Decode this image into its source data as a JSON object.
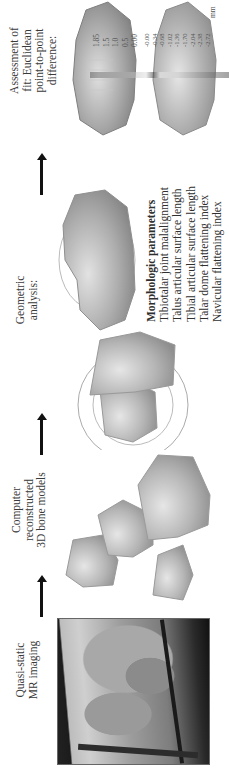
{
  "figure": {
    "steps": [
      {
        "id": "mr",
        "label_lines": [
          "Quasi-static",
          "MR imaging"
        ]
      },
      {
        "id": "models",
        "label_lines": [
          "Computer",
          "reconstructed",
          "3D bone models"
        ]
      },
      {
        "id": "geometric",
        "label_lines": [
          "Geometric",
          "analysis:"
        ]
      },
      {
        "id": "fit",
        "label_lines": [
          "Assessment of",
          "fit: Euclidean",
          "point-to-point",
          "difference:"
        ]
      }
    ],
    "morphologic": {
      "title": "Morphologic parameters",
      "items": [
        "Tibiotalar joint malalignment",
        "Talus articular surface length",
        "Tibial articular surface length",
        "Talar dome flattening index",
        "Navicular flattening index"
      ]
    },
    "scale": {
      "unit": "mm",
      "positive_ticks": [
        "1.85",
        "1.5",
        "1.0",
        "0.5",
        "0.00"
      ],
      "negative_ticks": [
        "-0.00",
        "-0.34",
        "-0.68",
        "-1.02",
        "-1.36",
        "-1.70",
        "-2.04",
        "-2.38",
        "-2.72"
      ],
      "note": "Only -0.00 and -2.72 were legible; the intermediate negative ticks are inferred as an evenly spaced series (step 0.34)."
    },
    "colors": {
      "bone": "#b9b9b9",
      "arrow": "#111111",
      "text": "#333333"
    }
  }
}
